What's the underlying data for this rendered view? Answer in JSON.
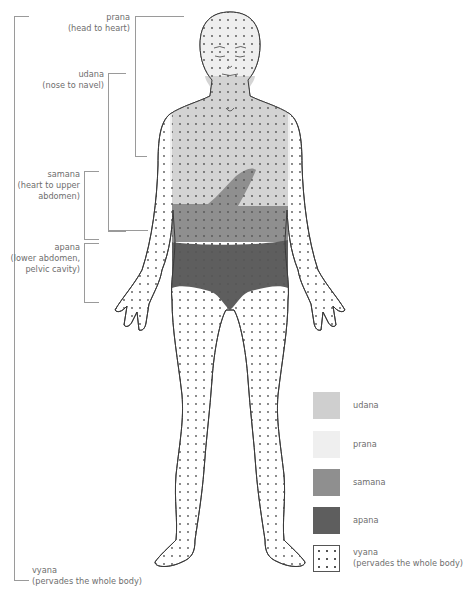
{
  "diagram": {
    "regions": [
      {
        "id": "prana",
        "name": "prana",
        "extent": "(head to heart)",
        "color": "#ededed"
      },
      {
        "id": "udana",
        "name": "udana",
        "extent": "(nose to navel)",
        "color": "#cfcfcf"
      },
      {
        "id": "samana",
        "name": "samana",
        "extent_line1": "(heart to upper",
        "extent_line2": "abdomen)",
        "color": "#8f8f8f"
      },
      {
        "id": "apana",
        "name": "apana",
        "extent_line1": "(lower abdomen,",
        "extent_line2": "pelvic cavity)",
        "color": "#5e5e5e"
      },
      {
        "id": "vyana",
        "name": "vyana",
        "extent": "(pervades the whole body)",
        "pattern": "dots"
      }
    ]
  },
  "labels": {
    "prana": {
      "name": "prana",
      "extent": "(head to heart)"
    },
    "udana": {
      "name": "udana",
      "extent": "(nose to navel)"
    },
    "samana": {
      "name": "samana",
      "extent_line1": "(heart to upper",
      "extent_line2": "abdomen)"
    },
    "apana": {
      "name": "apana",
      "extent_line1": "(lower abdomen,",
      "extent_line2": "pelvic cavity)"
    },
    "vyana": {
      "name": "vyana",
      "extent": "(pervades the whole body)"
    }
  },
  "legend": {
    "items": [
      {
        "label": "udana",
        "color": "#cfcfcf"
      },
      {
        "label": "prana",
        "color": "#efefef"
      },
      {
        "label": "samana",
        "color": "#8f8f8f"
      },
      {
        "label": "apana",
        "color": "#5e5e5e"
      },
      {
        "label_line1": "vyana",
        "label_line2": "(pervades the whole body)",
        "pattern": "dots"
      }
    ]
  },
  "colors": {
    "outline": "#3a3a3a",
    "bracket": "#9a9a9a",
    "dot": "#555555"
  }
}
